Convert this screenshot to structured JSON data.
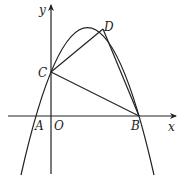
{
  "figure": {
    "axes": {
      "x_label": "x",
      "y_label": "y",
      "origin_label": "O"
    },
    "points": {
      "A": {
        "label": "A"
      },
      "B": {
        "label": "B"
      },
      "C": {
        "label": "C"
      },
      "D": {
        "label": "D"
      },
      "O": {
        "label": "O"
      }
    },
    "segments": [
      "CD",
      "DB",
      "CB"
    ]
  }
}
